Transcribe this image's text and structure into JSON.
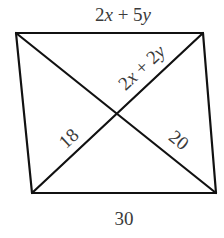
{
  "diagram": {
    "type": "quadrilateral-with-diagonals",
    "line_color": "#111111",
    "label_color": "#3a3a3a",
    "vertices": {
      "top_left": [
        16,
        33
      ],
      "top_right": [
        203,
        33
      ],
      "bottom_right": [
        216,
        193
      ],
      "bottom_left": [
        32,
        193
      ]
    },
    "intersection": [
      117,
      113
    ],
    "labels": {
      "top_side": {
        "coef1": "2",
        "var1": "x",
        "op": " + ",
        "coef2": "5",
        "var2": "y"
      },
      "upper_right_diagonal": {
        "coef1": "2",
        "var1": "x",
        "op": " + ",
        "coef2": "2",
        "var2": "y"
      },
      "lower_left_diagonal": "18",
      "lower_right_diagonal": "20",
      "bottom_side": "30"
    }
  }
}
